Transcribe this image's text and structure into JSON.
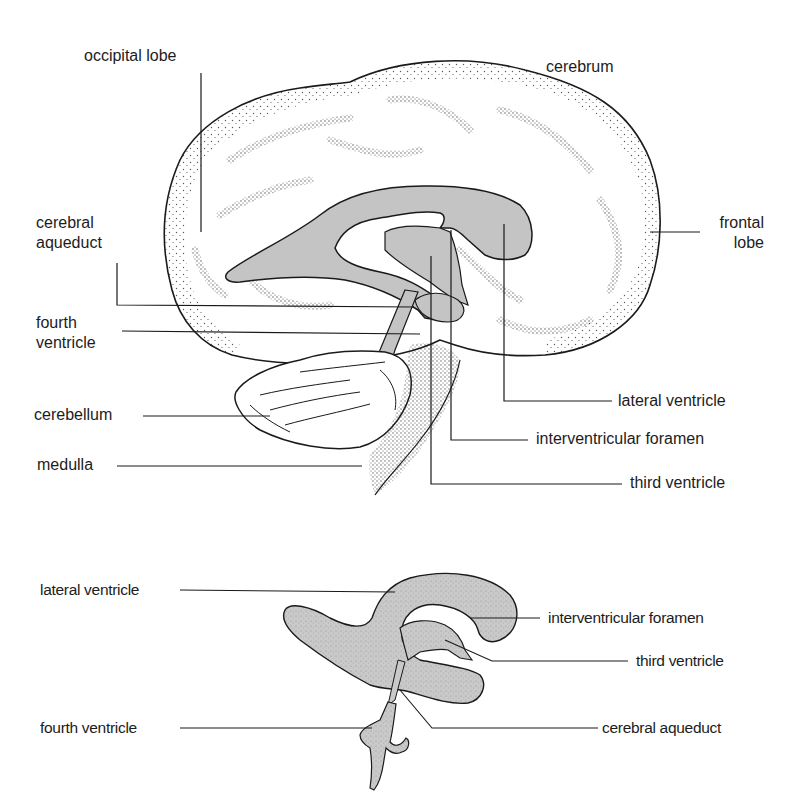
{
  "colors": {
    "background": "#ffffff",
    "outline": "#1a1a1a",
    "ventricle_fill": "#c4c4c4",
    "stipple": "#3a3a3a",
    "text": "#1c1c1c"
  },
  "upper_diagram": {
    "title": "Sagittal section of brain showing ventricles",
    "labels": {
      "occipital_lobe": "occipital lobe",
      "cerebrum": "cerebrum",
      "cerebral_aqueduct_1": "cerebral",
      "cerebral_aqueduct_2": "aqueduct",
      "frontal_lobe_1": "frontal",
      "frontal_lobe_2": "lobe",
      "fourth_ventricle_1": "fourth",
      "fourth_ventricle_2": "ventricle",
      "cerebellum": "cerebellum",
      "medulla": "medulla",
      "lateral_ventricle": "lateral ventricle",
      "interventricular_foramen": "interventricular foramen",
      "third_ventricle": "third ventricle"
    }
  },
  "lower_diagram": {
    "title": "Cast of ventricular system",
    "labels": {
      "lateral_ventricle": "lateral ventricle",
      "interventricular_foramen": "interventricular foramen",
      "third_ventricle": "third ventricle",
      "fourth_ventricle": "fourth ventricle",
      "cerebral_aqueduct": "cerebral aqueduct"
    }
  }
}
